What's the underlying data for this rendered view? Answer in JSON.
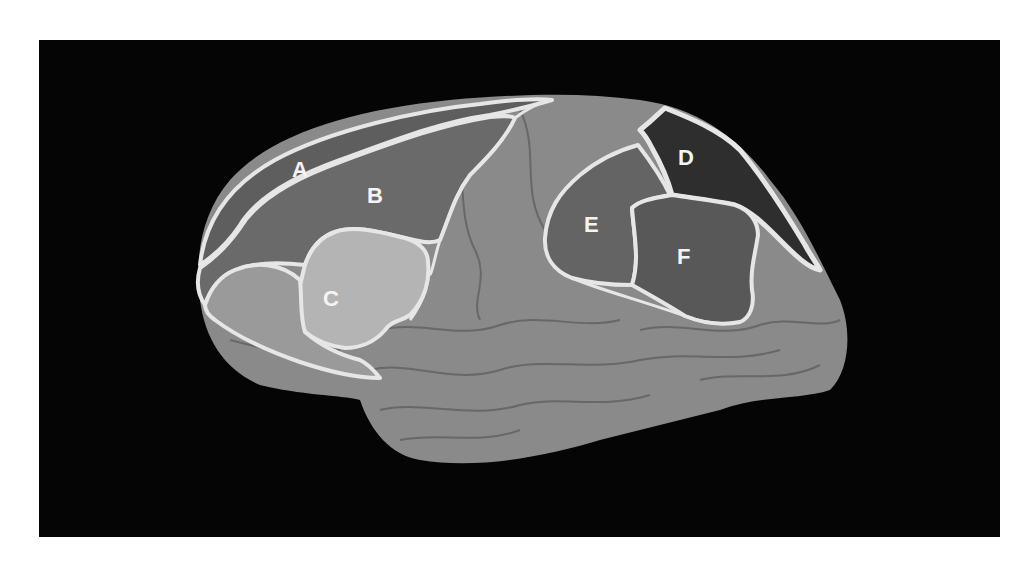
{
  "figure": {
    "background": "#050505",
    "outline_color": "#e6e6e6",
    "regions": [
      {
        "id": "A",
        "label": "A",
        "fill": "#5e5e5e",
        "x": 302,
        "y": 170
      },
      {
        "id": "B",
        "label": "B",
        "fill": "#6a6a6a",
        "x": 377,
        "y": 195
      },
      {
        "id": "C",
        "label": "C",
        "fill": "#b4b4b4",
        "x": 333,
        "y": 298
      },
      {
        "id": "D",
        "label": "D",
        "fill": "#2e2e2e",
        "x": 687,
        "y": 157
      },
      {
        "id": "E",
        "label": "E",
        "fill": "#646464",
        "x": 592,
        "y": 224
      },
      {
        "id": "F",
        "label": "F",
        "fill": "#585858",
        "x": 685,
        "y": 256
      }
    ],
    "cortex_fill": "#8c8c8c"
  }
}
